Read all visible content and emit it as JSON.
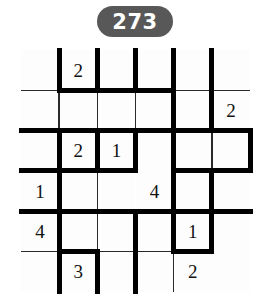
{
  "header": {
    "badge_label": "273"
  },
  "puzzle": {
    "type": "number-grid-walls",
    "rows": 6,
    "cols": 6,
    "cell_width": 38.17,
    "cell_height": 40.33,
    "colors": {
      "badge_background": "#585858",
      "badge_text": "#ffffff",
      "wall": "#000000",
      "thin_line": "#2a2a2a",
      "cell_background": "#fdfdfd",
      "number_text": "#111111"
    },
    "clues": [
      {
        "row": 0,
        "col": 1,
        "value": "2"
      },
      {
        "row": 1,
        "col": 5,
        "value": "2"
      },
      {
        "row": 2,
        "col": 1,
        "value": "2"
      },
      {
        "row": 2,
        "col": 2,
        "value": "1"
      },
      {
        "row": 3,
        "col": 0,
        "value": "1"
      },
      {
        "row": 3,
        "col": 3,
        "value": "4"
      },
      {
        "row": 4,
        "col": 0,
        "value": "4"
      },
      {
        "row": 4,
        "col": 4,
        "value": "1"
      },
      {
        "row": 5,
        "col": 1,
        "value": "3"
      },
      {
        "row": 5,
        "col": 4,
        "value": "2"
      }
    ],
    "thin_lines": {
      "horizontal": [
        {
          "row": 1,
          "col": 0
        },
        {
          "row": 1,
          "col": 4
        },
        {
          "row": 1,
          "col": 5
        },
        {
          "row": 2,
          "col": 4
        },
        {
          "row": 3,
          "col": 0
        },
        {
          "row": 3,
          "col": 1
        },
        {
          "row": 3,
          "col": 2
        },
        {
          "row": 4,
          "col": 2
        },
        {
          "row": 4,
          "col": 3
        },
        {
          "row": 4,
          "col": 5
        },
        {
          "row": 5,
          "col": 0
        },
        {
          "row": 5,
          "col": 2
        },
        {
          "row": 5,
          "col": 3
        }
      ],
      "vertical": [
        {
          "row": 0,
          "col": 1
        },
        {
          "row": 0,
          "col": 5
        },
        {
          "row": 1,
          "col": 1
        },
        {
          "row": 1,
          "col": 2
        },
        {
          "row": 1,
          "col": 3
        },
        {
          "row": 2,
          "col": 5
        },
        {
          "row": 3,
          "col": 1
        },
        {
          "row": 3,
          "col": 2
        },
        {
          "row": 3,
          "col": 4
        },
        {
          "row": 4,
          "col": 1
        },
        {
          "row": 4,
          "col": 2
        },
        {
          "row": 4,
          "col": 4
        },
        {
          "row": 5,
          "col": 1
        },
        {
          "row": 5,
          "col": 2
        },
        {
          "row": 5,
          "col": 4
        }
      ]
    },
    "walls": {
      "horizontal": [
        {
          "row": 1,
          "col": 1
        },
        {
          "row": 1,
          "col": 2
        },
        {
          "row": 1,
          "col": 3
        },
        {
          "row": 2,
          "col": 0
        },
        {
          "row": 2,
          "col": 1
        },
        {
          "row": 2,
          "col": 2
        },
        {
          "row": 2,
          "col": 3
        },
        {
          "row": 2,
          "col": 4
        },
        {
          "row": 2,
          "col": 5
        },
        {
          "row": 3,
          "col": 0
        },
        {
          "row": 3,
          "col": 1
        },
        {
          "row": 3,
          "col": 2
        },
        {
          "row": 3,
          "col": 4
        },
        {
          "row": 3,
          "col": 5
        },
        {
          "row": 4,
          "col": 0
        },
        {
          "row": 4,
          "col": 1
        },
        {
          "row": 4,
          "col": 2
        },
        {
          "row": 4,
          "col": 3
        },
        {
          "row": 4,
          "col": 4
        },
        {
          "row": 4,
          "col": 5
        },
        {
          "row": 5,
          "col": 1
        },
        {
          "row": 5,
          "col": 4
        }
      ],
      "vertical": [
        {
          "row": 0,
          "col": 1
        },
        {
          "row": 0,
          "col": 2
        },
        {
          "row": 0,
          "col": 3
        },
        {
          "row": 0,
          "col": 4
        },
        {
          "row": 0,
          "col": 5
        },
        {
          "row": 1,
          "col": 4
        },
        {
          "row": 1,
          "col": 5
        },
        {
          "row": 2,
          "col": 1
        },
        {
          "row": 2,
          "col": 2
        },
        {
          "row": 2,
          "col": 3
        },
        {
          "row": 2,
          "col": 4
        },
        {
          "row": 2,
          "col": 6
        },
        {
          "row": 3,
          "col": 1
        },
        {
          "row": 3,
          "col": 4
        },
        {
          "row": 3,
          "col": 5
        },
        {
          "row": 4,
          "col": 1
        },
        {
          "row": 4,
          "col": 3
        },
        {
          "row": 4,
          "col": 4
        },
        {
          "row": 4,
          "col": 5
        },
        {
          "row": 5,
          "col": 1
        },
        {
          "row": 5,
          "col": 2
        },
        {
          "row": 5,
          "col": 3
        }
      ]
    }
  }
}
